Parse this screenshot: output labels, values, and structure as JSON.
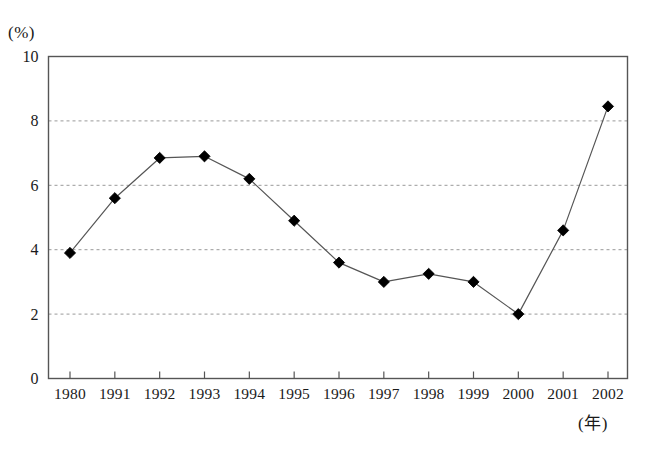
{
  "chart_data": {
    "type": "line",
    "title": "",
    "subtitle": "",
    "xlabel": "(年)",
    "ylabel": "(%)",
    "categories": [
      "1980",
      "1991",
      "1992",
      "1993",
      "1994",
      "1995",
      "1996",
      "1997",
      "1998",
      "1999",
      "2000",
      "2001",
      "2002"
    ],
    "values": [
      3.9,
      5.6,
      6.85,
      6.9,
      6.2,
      4.9,
      3.6,
      3.0,
      3.25,
      3.0,
      2.0,
      4.6,
      8.45
    ],
    "series": [
      {
        "name": "",
        "values": [
          3.9,
          5.6,
          6.85,
          6.9,
          6.2,
          4.9,
          3.6,
          3.0,
          3.25,
          3.0,
          2.0,
          4.6,
          8.45
        ]
      }
    ],
    "ylim": [
      0,
      10
    ],
    "yticks": [
      0,
      2,
      4,
      6,
      8,
      10
    ],
    "ytick_labels": [
      "0",
      "2",
      "4",
      "6",
      "8",
      "10"
    ],
    "grid": true,
    "grid_axis": "y",
    "grid_style": "dashed",
    "legend": false,
    "legend_position": "none",
    "marker": "diamond",
    "line_color": "#555555",
    "marker_color": "#000000",
    "grid_color": "#999999",
    "frame_color": "#555555",
    "background": "#ffffff"
  },
  "axes": {
    "y_unit": "(%)",
    "x_unit": "(年)"
  }
}
